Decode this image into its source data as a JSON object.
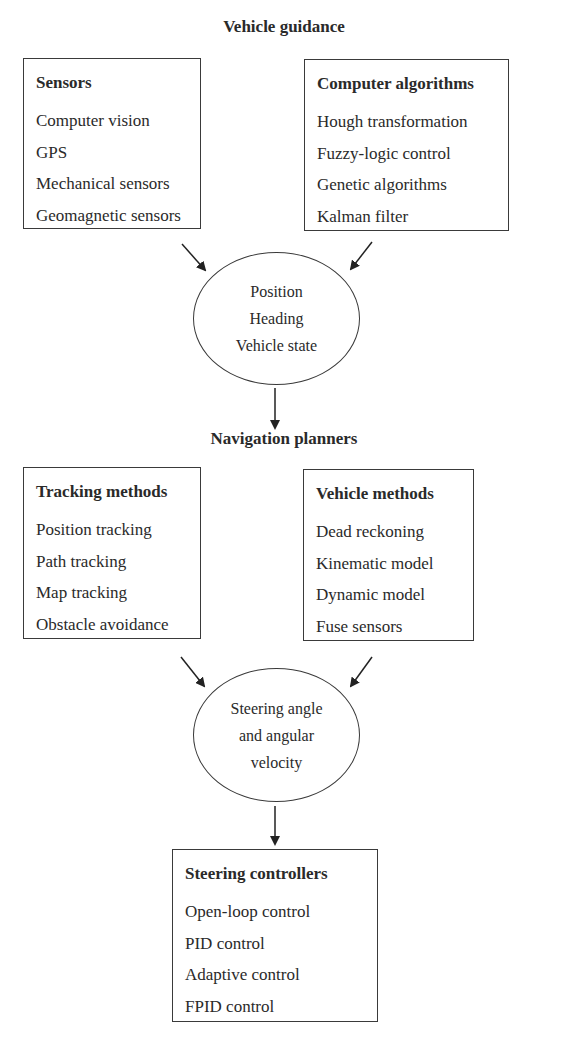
{
  "diagram": {
    "section1_title": "Vehicle guidance",
    "sensors": {
      "heading": "Sensors",
      "items": [
        "Computer vision",
        "GPS",
        "Mechanical sensors",
        "Geomagnetic sensors"
      ]
    },
    "algorithms": {
      "heading": "Computer algorithms",
      "items": [
        "Hough transformation",
        "Fuzzy-logic control",
        "Genetic algorithms",
        "Kalman filter"
      ]
    },
    "state_node": {
      "lines": [
        "Position",
        "Heading",
        "Vehicle state"
      ]
    },
    "section2_title": "Navigation planners",
    "tracking": {
      "heading": "Tracking methods",
      "items": [
        "Position tracking",
        "Path tracking",
        "Map tracking",
        "Obstacle avoidance"
      ]
    },
    "vehicle_methods": {
      "heading": "Vehicle methods",
      "items": [
        "Dead reckoning",
        "Kinematic model",
        "Dynamic model",
        "Fuse sensors"
      ]
    },
    "steering_node": {
      "lines": [
        "Steering angle",
        "and angular",
        "velocity"
      ]
    },
    "controllers": {
      "heading": "Steering controllers",
      "items": [
        "Open-loop control",
        "PID control",
        "Adaptive control",
        "FPID control"
      ]
    }
  }
}
